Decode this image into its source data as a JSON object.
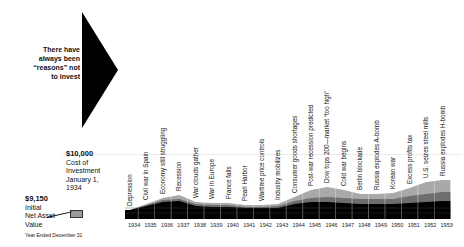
{
  "intro_text": [
    "There have",
    "always been",
    "“reasons” not",
    "to invest"
  ],
  "cost_label": {
    "amount": "$10,000",
    "lines": [
      "Cost of",
      "Investment",
      "January 1,",
      "1934"
    ]
  },
  "initial_label": {
    "amount": "$9,150",
    "lines": [
      "Initial",
      "Net Asset",
      "Value"
    ]
  },
  "footnote": "Year Ended December 31",
  "chart_data": {
    "type": "area",
    "title": "There have always been “reasons” not to invest",
    "xlabel": "Year Ended December 31",
    "ylabel": "",
    "categories": [
      "1934",
      "1935",
      "1936",
      "1937",
      "1938",
      "1939",
      "1940",
      "1941",
      "1942",
      "1943",
      "1944",
      "1945",
      "1946",
      "1947",
      "1948",
      "1949",
      "1950",
      "1951",
      "1952",
      "1953"
    ],
    "events": [
      "Depression",
      "Civil war in Spain",
      "Economy still struggling",
      "Recession",
      "War clouds gather",
      "War in Europe",
      "France falls",
      "Pearl Harbor",
      "Wartime price controls",
      "Industry mobilizes",
      "Consumer goods shortages",
      "Post-war recession predicted",
      "Dow tops 200—market “too high”",
      "Cold war begins",
      "Berlin blockade",
      "Russia explodes A-bomb",
      "Korean war",
      "Excess profits tax",
      "U.S. seizes steel mills",
      "Russia explodes H-bomb"
    ],
    "series": [
      {
        "name": "Base (black)",
        "values": [
          9,
          13,
          17,
          18,
          13,
          12,
          12,
          11,
          11,
          11,
          15,
          17,
          17,
          16,
          15,
          15,
          15,
          16,
          17,
          18
        ]
      },
      {
        "name": "Middle (dark gray)",
        "values": [
          0,
          1,
          2,
          2,
          2,
          2,
          2,
          1,
          1,
          2,
          3,
          4,
          5,
          5,
          5,
          5,
          5,
          7,
          8,
          9
        ]
      },
      {
        "name": "Top (light gray)",
        "values": [
          0,
          1,
          2,
          4,
          2,
          2,
          2,
          2,
          2,
          2,
          4,
          8,
          10,
          8,
          5,
          5,
          6,
          8,
          12,
          12
        ]
      }
    ],
    "reference_lines": [
      {
        "label": "$10,000",
        "meaning": "Cost of Investment January 1, 1934"
      }
    ],
    "initial_value": "$9,150",
    "grid": true,
    "colors": {
      "base": "#000000",
      "middle": "#6e6e6e",
      "top": "#a9a9a9",
      "grid": "#ffffff"
    }
  }
}
